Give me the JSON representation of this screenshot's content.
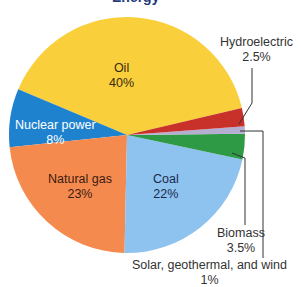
{
  "title_fragment": "Energy",
  "chart_data": {
    "type": "pie",
    "title": "",
    "center": [
      127,
      135
    ],
    "radius": 118,
    "start_angle_deg": 13.2,
    "slices": [
      {
        "label": "Oil",
        "value": 40,
        "display": "40%",
        "color": "#f9cf3b",
        "text_color": "#3a2a10"
      },
      {
        "label": "Nuclear power",
        "value": 8,
        "display": "8%",
        "color": "#1f82cf",
        "text_color": "#ffffff"
      },
      {
        "label": "Natural gas",
        "value": 23,
        "display": "23%",
        "color": "#f58a4f",
        "text_color": "#3a1a10"
      },
      {
        "label": "Coal",
        "value": 22,
        "display": "22%",
        "color": "#8ec3ef",
        "text_color": "#1a2a4a"
      },
      {
        "label": "Biomass",
        "value": 3.5,
        "display": "3.5%",
        "color": "#2e9a45",
        "text_color": "#333333"
      },
      {
        "label": "Solar, geothermal, and wind",
        "value": 1,
        "display": "1%",
        "color": "#b4aed0",
        "text_color": "#333333"
      },
      {
        "label": "Hydroelectric",
        "value": 2.5,
        "display": "2.5%",
        "color": "#c8302a",
        "text_color": "#333333"
      }
    ]
  },
  "labels": {
    "oil": {
      "name": "Oil",
      "pct": "40%"
    },
    "nuclear": {
      "name": "Nuclear power",
      "pct": "8%"
    },
    "gas": {
      "name": "Natural gas",
      "pct": "23%"
    },
    "coal": {
      "name": "Coal",
      "pct": "22%"
    },
    "biomass": {
      "name": "Biomass",
      "pct": "3.5%"
    },
    "solar": {
      "name": "Solar, geothermal, and wind",
      "pct": "1%"
    },
    "hydro": {
      "name": "Hydroelectric",
      "pct": "2.5%"
    }
  }
}
